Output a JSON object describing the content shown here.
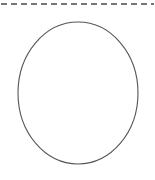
{
  "canvas": {
    "width": 155,
    "height": 180,
    "background_color": "#ffffff"
  },
  "figure": {
    "elements": [
      {
        "name": "dashed-line",
        "shape": "line",
        "orientation": "horizontal",
        "x1": 1,
        "y1": 4,
        "x2": 154,
        "y2": 4,
        "stroke_color": "#4a4a4a",
        "stroke_width": 1.6,
        "dash_length": 6,
        "gap_length": 4
      },
      {
        "name": "circle-outline",
        "shape": "ellipse",
        "center_x": 78,
        "center_y": 93,
        "radius_x": 60,
        "radius_y": 71,
        "stroke_color": "#555555",
        "stroke_width": 1.1,
        "fill": "none"
      }
    ]
  }
}
